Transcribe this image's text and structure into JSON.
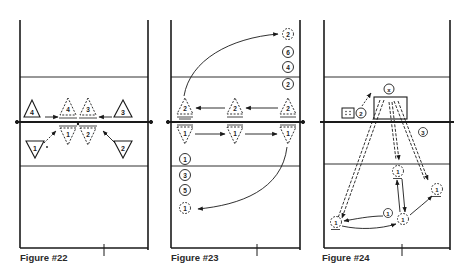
{
  "figures": [
    {
      "caption": "Figure #22",
      "description": "Blocking footwork: front-row blockers move in to close the block at the net",
      "players_solid": [
        {
          "label": "4",
          "shape": "triangle-up",
          "side": "far"
        },
        {
          "label": "3",
          "shape": "triangle-up",
          "side": "far"
        },
        {
          "label": "1",
          "shape": "triangle-down",
          "side": "near"
        },
        {
          "label": "2",
          "shape": "triangle-down",
          "side": "near"
        }
      ],
      "players_dashed": [
        {
          "label": "4",
          "shape": "triangle-up",
          "side": "far"
        },
        {
          "label": "3",
          "shape": "triangle-up",
          "side": "far"
        },
        {
          "label": "1",
          "shape": "triangle-down",
          "side": "near"
        },
        {
          "label": "2",
          "shape": "triangle-down",
          "side": "near"
        }
      ]
    },
    {
      "caption": "Figure #23",
      "description": "Shuffle drill along the net with rotating lines",
      "net_players_far": [
        "2",
        "2",
        "2"
      ],
      "net_players_near": [
        "1",
        "1",
        "1"
      ],
      "far_queue": [
        {
          "label": "2",
          "dashed": true
        },
        {
          "label": "6",
          "dashed": false
        },
        {
          "label": "4",
          "dashed": false
        },
        {
          "label": "2",
          "dashed": false
        }
      ],
      "near_queue": [
        {
          "label": "1",
          "dashed": false
        },
        {
          "label": "3",
          "dashed": false
        },
        {
          "label": "5",
          "dashed": false
        },
        {
          "label": "1",
          "dashed": true
        }
      ]
    },
    {
      "caption": "Figure #24",
      "description": "Coach-on-box hitting drill: defender digs, moves through three positions",
      "coach_label": "x",
      "feeder_label": "2",
      "ball_cart": "box",
      "attack_label": "3",
      "movement_label": "1",
      "defender_label": "1"
    }
  ]
}
